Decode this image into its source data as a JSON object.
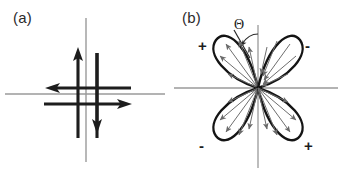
{
  "figure": {
    "background_color": "#ffffff",
    "axis_color": "#8f8f8f",
    "ink_color": "#1d1d1d",
    "lobe_color": "#141414",
    "ray_color": "#6e6e6e"
  },
  "panels": [
    {
      "id": "a",
      "label": "(a)",
      "description": "s-wave isotropic order parameter: four bold arrows on orthogonal axes",
      "arrows": [
        {
          "name": "up-arrow",
          "direction": "up"
        },
        {
          "name": "down-arrow",
          "direction": "down"
        },
        {
          "name": "left-arrow",
          "direction": "left"
        },
        {
          "name": "right-arrow",
          "direction": "right"
        }
      ]
    },
    {
      "id": "b",
      "label": "(b)",
      "description": "d-wave four-lobe order parameter with alternating sign quadrants and angle Theta",
      "angle_label": "Θ",
      "quadrant_signs": [
        {
          "name": "sign-top-left",
          "value": "+",
          "quadrant": "top-left"
        },
        {
          "name": "sign-top-right",
          "value": "-",
          "quadrant": "top-right"
        },
        {
          "name": "sign-bottom-left",
          "value": "-",
          "quadrant": "bottom-left"
        },
        {
          "name": "sign-bottom-right",
          "value": "+",
          "quadrant": "bottom-right"
        }
      ],
      "lobes": [
        {
          "name": "lobe-top-left",
          "sign": "+",
          "axis_angle_deg": 135
        },
        {
          "name": "lobe-top-right",
          "sign": "-",
          "axis_angle_deg": 45
        },
        {
          "name": "lobe-bottom-left",
          "sign": "-",
          "axis_angle_deg": 225
        },
        {
          "name": "lobe-bottom-right",
          "sign": "+",
          "axis_angle_deg": 315
        }
      ]
    }
  ]
}
